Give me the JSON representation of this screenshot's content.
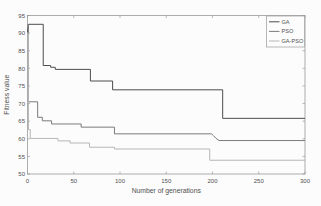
{
  "figure": {
    "background": "#fcfcfc",
    "plot_border_color": "#9a9a9a",
    "tick_color": "#9a9a9a",
    "text_color": "#4f4f4f",
    "legend_border_color": "#9a9a9a"
  },
  "chart_data": {
    "type": "line",
    "subtype": "step-convergence",
    "title": "",
    "xlabel": "Number of generations",
    "ylabel": "Fitness value",
    "xlim": [
      0,
      300
    ],
    "ylim": [
      50,
      95
    ],
    "xticks": [
      0,
      50,
      100,
      150,
      200,
      250,
      300
    ],
    "yticks": [
      50,
      55,
      60,
      65,
      70,
      75,
      80,
      85,
      90,
      95
    ],
    "grid": false,
    "legend": {
      "position": "northeast",
      "entries": [
        "GA",
        "PSO",
        "GA-PSO"
      ]
    },
    "series": [
      {
        "name": "GA",
        "color": "#4d4d4d",
        "points": [
          [
            0,
            90.2
          ],
          [
            1,
            92.5
          ],
          [
            17,
            92.5
          ],
          [
            17,
            80.8
          ],
          [
            25,
            80.8
          ],
          [
            25,
            80.3
          ],
          [
            30,
            80.3
          ],
          [
            30,
            79.7
          ],
          [
            68,
            79.7
          ],
          [
            68,
            76.4
          ],
          [
            92,
            76.4
          ],
          [
            92,
            73.9
          ],
          [
            211,
            73.9
          ],
          [
            211,
            65.8
          ],
          [
            300,
            65.8
          ]
        ]
      },
      {
        "name": "PSO",
        "color": "#7b7b7b",
        "points": [
          [
            0,
            92.4
          ],
          [
            1,
            92.4
          ],
          [
            1,
            70.5
          ],
          [
            11,
            70.5
          ],
          [
            11,
            66.1
          ],
          [
            16,
            66.1
          ],
          [
            16,
            65.1
          ],
          [
            26,
            65.1
          ],
          [
            26,
            64.2
          ],
          [
            58,
            64.2
          ],
          [
            58,
            63.3
          ],
          [
            94,
            63.3
          ],
          [
            94,
            61.4
          ],
          [
            199,
            61.4
          ],
          [
            201,
            60.9
          ],
          [
            204,
            60.1
          ],
          [
            207,
            59.5
          ],
          [
            300,
            59.5
          ]
        ]
      },
      {
        "name": "GA-PSO",
        "color": "#b6b6b6",
        "points": [
          [
            0,
            90.0
          ],
          [
            1,
            90.0
          ],
          [
            1,
            62.6
          ],
          [
            3,
            62.6
          ],
          [
            3,
            60.1
          ],
          [
            33,
            60.1
          ],
          [
            33,
            59.4
          ],
          [
            46,
            59.4
          ],
          [
            46,
            58.8
          ],
          [
            67,
            58.8
          ],
          [
            67,
            57.6
          ],
          [
            94,
            57.6
          ],
          [
            94,
            57.1
          ],
          [
            197,
            57.1
          ],
          [
            197,
            53.9
          ],
          [
            300,
            53.9
          ]
        ]
      }
    ]
  }
}
